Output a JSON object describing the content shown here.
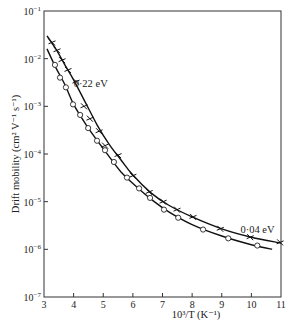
{
  "chart_data": {
    "type": "scatter",
    "title": "",
    "xlabel": "10³/T  (K⁻¹)",
    "ylabel": "Drift mobility  (cm² V⁻¹ s⁻¹)",
    "xlim": [
      3,
      11
    ],
    "ylim": [
      1e-07,
      0.1
    ],
    "yscale": "log",
    "x_ticks": [
      "3",
      "4",
      "5",
      "6",
      "7",
      "8",
      "9",
      "10",
      "11"
    ],
    "y_ticks": [
      {
        "base": "10",
        "exp": "−1"
      },
      {
        "base": "10",
        "exp": "−2"
      },
      {
        "base": "10",
        "exp": "−3"
      },
      {
        "base": "10",
        "exp": "−4"
      },
      {
        "base": "10",
        "exp": "−5"
      },
      {
        "base": "10",
        "exp": "−6"
      },
      {
        "base": "10",
        "exp": "−7"
      }
    ],
    "grid": false,
    "legend": null,
    "annotations": [
      {
        "text": "0·22 eV",
        "x": 4.0,
        "y": 0.003
      },
      {
        "text": "0·04 eV",
        "x": 9.9,
        "y": 2.6e-06
      }
    ],
    "series": [
      {
        "name": "crosses",
        "marker": "x",
        "x": [
          3.27,
          3.44,
          3.61,
          3.81,
          4.08,
          4.35,
          4.55,
          4.86,
          5.06,
          5.5,
          6.0,
          6.55,
          7.02,
          7.49,
          8.03,
          8.95,
          9.96,
          10.97
        ],
        "y": [
          0.022,
          0.015,
          0.0093,
          0.0058,
          0.0033,
          0.001,
          0.00055,
          0.0003,
          0.00015,
          9.5e-05,
          3.5e-05,
          1.6e-05,
          1e-05,
          6.8e-06,
          4.8e-06,
          2.7e-06,
          1.8e-06,
          1.4e-06
        ]
      },
      {
        "name": "circles",
        "marker": "o",
        "x": [
          3.37,
          3.54,
          3.74,
          3.98,
          4.22,
          4.49,
          4.79,
          5.06,
          5.36,
          5.8,
          6.21,
          6.58,
          7.05,
          7.53,
          8.37,
          9.22,
          10.2
        ],
        "y": [
          0.0074,
          0.004,
          0.0025,
          0.0011,
          0.00066,
          0.00035,
          0.00019,
          0.00012,
          6.8e-05,
          3.2e-05,
          1.9e-05,
          1.2e-05,
          6.8e-06,
          4.6e-06,
          2.6e-06,
          1.7e-06,
          1.2e-06
        ]
      }
    ],
    "curves": [
      {
        "name": "fit-upper",
        "x": [
          3.1,
          3.4,
          3.7,
          4.0,
          4.4,
          4.8,
          5.2,
          5.6,
          6.0,
          6.6,
          7.2,
          8.0,
          9.0,
          10.0,
          11.0
        ],
        "y": [
          0.03,
          0.016,
          0.0075,
          0.0036,
          0.0012,
          0.0004,
          0.00016,
          7.5e-05,
          3.6e-05,
          1.55e-05,
          8.5e-06,
          4.8e-06,
          2.7e-06,
          1.8e-06,
          1.35e-06
        ]
      },
      {
        "name": "fit-lower",
        "x": [
          3.1,
          3.4,
          3.7,
          4.0,
          4.4,
          4.8,
          5.2,
          5.6,
          6.0,
          6.6,
          7.2,
          8.0,
          9.0,
          10.0,
          10.7
        ],
        "y": [
          0.016,
          0.0065,
          0.0029,
          0.0011,
          0.00043,
          0.00019,
          8.8e-05,
          4.2e-05,
          2.4e-05,
          1.15e-05,
          6.2e-06,
          3.3e-06,
          1.9e-06,
          1.25e-06,
          1e-06
        ]
      }
    ]
  }
}
